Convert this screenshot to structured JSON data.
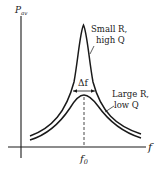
{
  "diagram": {
    "type": "resonance-curves",
    "y_axis_label": "P",
    "y_axis_subscript": "av",
    "x_axis_label": "f",
    "center_label": "f",
    "center_subscript": "0",
    "bandwidth_label": "Δf",
    "curves": [
      {
        "name": "high-q-curve",
        "label_line1": "Small R,",
        "label_line2": "high Q"
      },
      {
        "name": "low-q-curve",
        "label_line1": "Large R,",
        "label_line2": "low Q"
      }
    ],
    "colors": {
      "ink": "#1a1a1a",
      "background": "#ffffff"
    }
  }
}
